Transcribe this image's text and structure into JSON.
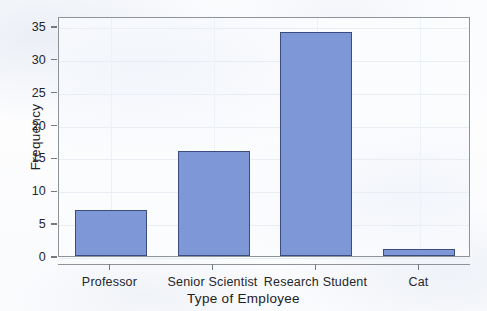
{
  "chart_data": {
    "type": "bar",
    "title": "",
    "subtitle": "",
    "categories": [
      "Professor",
      "Senior Scientist",
      "Research Student",
      "Cat"
    ],
    "values": [
      7,
      16,
      34,
      1
    ],
    "series": [
      {
        "name": "Frequency",
        "values": [
          7,
          16,
          34,
          1
        ]
      }
    ],
    "xlabel": "Type of Employee",
    "ylabel": "Frequency",
    "ylim": [
      0,
      36.5
    ],
    "yticks": [
      0,
      5,
      10,
      15,
      20,
      25,
      30,
      35
    ],
    "ytick_labels": [
      "0",
      "5",
      "10",
      "15",
      "20",
      "25",
      "30",
      "35"
    ],
    "xtick_labels": [
      "Professor",
      "Senior Scientist",
      "Research Student",
      "Cat"
    ],
    "grid": true,
    "grid_axis": "both",
    "legend": false,
    "legend_position": "none",
    "annotations": [],
    "bar_fill_color": "#7e97d6",
    "bar_border_color": "#3c4c7e",
    "plot_background_color": "#fbfcfe",
    "grid_color": "#e9edf4",
    "axis_color": "#8e9299",
    "text_color": "#23262b"
  },
  "axes": {
    "y": {
      "title": "Frequency",
      "ticks": [
        {
          "label": "35",
          "value": 35
        },
        {
          "label": "30",
          "value": 30
        },
        {
          "label": "25",
          "value": 25
        },
        {
          "label": "20",
          "value": 20
        },
        {
          "label": "15",
          "value": 15
        },
        {
          "label": "10",
          "value": 10
        },
        {
          "label": "5",
          "value": 5
        },
        {
          "label": "0",
          "value": 0
        }
      ]
    },
    "x": {
      "title": "Type of Employee",
      "ticks": [
        {
          "label": "Professor"
        },
        {
          "label": "Senior Scientist"
        },
        {
          "label": "Research Student"
        },
        {
          "label": "Cat"
        }
      ]
    }
  }
}
